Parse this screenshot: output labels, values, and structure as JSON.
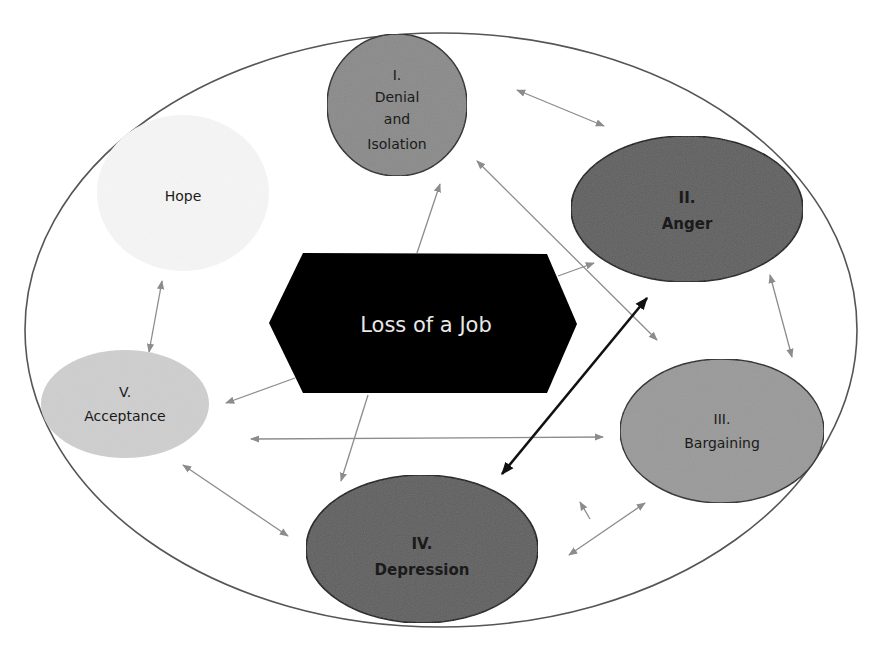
{
  "diagram": {
    "center": {
      "label": "Loss of a Job",
      "fill": "#000000",
      "text_color": "#e8e8e8"
    },
    "outer_boundary": {
      "stroke": "#555555"
    },
    "nodes": {
      "denial": {
        "numeral": "I.",
        "line1": "Denial",
        "line2": "and",
        "line3": "Isolation",
        "fill": "#8a8a8a"
      },
      "anger": {
        "numeral": "II.",
        "name": "Anger",
        "fill": "#5e5e5e"
      },
      "bargaining": {
        "numeral": "III.",
        "name": "Bargaining",
        "fill": "#9a9a9a"
      },
      "depression": {
        "numeral": "IV.",
        "name": "Depression",
        "fill": "#5e5e5e"
      },
      "acceptance": {
        "numeral": "V.",
        "name": "Acceptance",
        "fill": "#cfcfcf"
      },
      "hope": {
        "name": "Hope",
        "fill": "#f7f7f7"
      }
    },
    "arrow_colors": {
      "light": "#8c8c8c",
      "dark": "#111111"
    },
    "connections": [
      {
        "from": "Loss of a Job",
        "to": "I. Denial and Isolation",
        "type": "single"
      },
      {
        "from": "Loss of a Job",
        "to": "II. Anger",
        "type": "single"
      },
      {
        "from": "Loss of a Job",
        "to": "V. Acceptance",
        "type": "single"
      },
      {
        "from": "Loss of a Job",
        "to": "IV. Depression",
        "type": "single"
      },
      {
        "from": "I. Denial and Isolation",
        "to": "II. Anger",
        "type": "double"
      },
      {
        "from": "I. Denial and Isolation",
        "to": "III. Bargaining",
        "type": "double"
      },
      {
        "from": "II. Anger",
        "to": "III. Bargaining",
        "type": "double"
      },
      {
        "from": "II. Anger",
        "to": "IV. Depression",
        "type": "double-bold"
      },
      {
        "from": "III. Bargaining",
        "to": "IV. Depression",
        "type": "double"
      },
      {
        "from": "III. Bargaining",
        "to": "V. Acceptance",
        "type": "double"
      },
      {
        "from": "IV. Depression",
        "to": "V. Acceptance",
        "type": "double"
      },
      {
        "from": "V. Acceptance",
        "to": "Hope",
        "type": "double"
      },
      {
        "from": "IV. Depression",
        "to": "III. Bargaining",
        "type": "single-short"
      }
    ]
  }
}
